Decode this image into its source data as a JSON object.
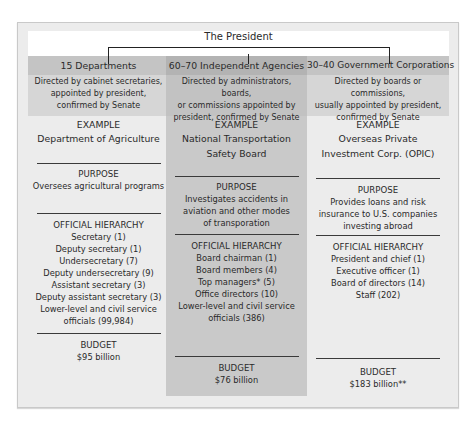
{
  "president": {
    "label": "The President"
  },
  "columns": [
    {
      "heading": "15 Departments",
      "description": [
        "Directed by cabinet secretaries,",
        "appointed by president,",
        "confirmed by Senate"
      ],
      "example_label": "EXAMPLE",
      "example": [
        "Department of Agriculture"
      ],
      "purpose_label": "PURPOSE",
      "purpose": [
        "Oversees agricultural programs"
      ],
      "hierarchy_label": "OFFICIAL HIERARCHY",
      "hierarchy": [
        "Secretary (1)",
        "Deputy secretary (1)",
        "Undersecretary (7)",
        "Deputy undersecretary (9)",
        "Assistant secretary (3)",
        "Deputy assistant secretary (3)",
        "Lower-level and civil service",
        "officials (99,984)"
      ],
      "budget_label": "BUDGET",
      "budget": "$95 billion"
    },
    {
      "heading": "60–70 Independent Agencies",
      "description": [
        "Directed by administrators, boards,",
        "or commissions appointed by",
        "president, confirmed by Senate"
      ],
      "example_label": "EXAMPLE",
      "example": [
        "National Transportation",
        "Safety Board"
      ],
      "purpose_label": "PURPOSE",
      "purpose": [
        "Investigates accidents in",
        "aviation and other modes",
        "of transporation"
      ],
      "hierarchy_label": "OFFICIAL HIERARCHY",
      "hierarchy": [
        "Board chairman (1)",
        "Board members (4)",
        "Top managers* (5)",
        "Office directors (10)",
        "Lower-level and civil service",
        "officials (386)"
      ],
      "budget_label": "BUDGET",
      "budget": "$76 billion"
    },
    {
      "heading": "30–40 Government Corporations",
      "description": [
        "Directed by boards or commissions,",
        "usually appointed by president,",
        "confirmed by Senate"
      ],
      "example_label": "EXAMPLE",
      "example": [
        "Overseas Private",
        "Investment Corp. (OPIC)"
      ],
      "purpose_label": "PURPOSE",
      "purpose": [
        "Provides loans and risk",
        "insurance to U.S. companies",
        "investing abroad"
      ],
      "hierarchy_label": "OFFICIAL HIERARCHY",
      "hierarchy": [
        "President and chief (1)",
        "Executive officer (1)",
        "Board of directors (14)",
        "Staff (202)"
      ],
      "budget_label": "BUDGET",
      "budget": "$183 billion**"
    }
  ],
  "colors": {
    "frame_bg": "#ececec",
    "head_bg": "#c4c4c4",
    "mid_column_bg": "#c9c9c9",
    "line": "#222222"
  }
}
